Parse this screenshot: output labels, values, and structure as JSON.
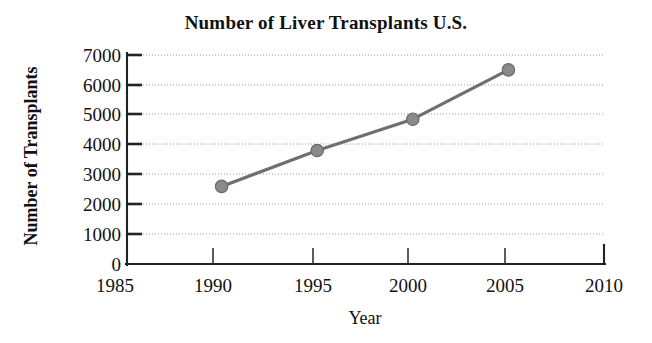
{
  "chart_data": {
    "type": "line",
    "title": "Number of Liver Transplants U.S.",
    "xlabel": "Year",
    "ylabel": "Number of Transplants",
    "x": [
      1990,
      1995,
      2000,
      2005
    ],
    "values": [
      2600,
      3800,
      4850,
      6500
    ],
    "series": [
      {
        "name": "Liver transplants",
        "x": [
          1990,
          1995,
          2000,
          2005
        ],
        "values": [
          2600,
          3800,
          4850,
          6500
        ]
      }
    ],
    "xlim": [
      1985,
      2010
    ],
    "ylim": [
      0,
      7000
    ],
    "xticks": [
      1985,
      1990,
      1995,
      2000,
      2005,
      2010
    ],
    "yticks": [
      0,
      1000,
      2000,
      3000,
      4000,
      5000,
      6000,
      7000
    ],
    "xtick_labels": [
      "1985",
      "1990",
      "1995",
      "2000",
      "2005",
      "2010"
    ],
    "ytick_labels": [
      "0",
      "1000",
      "2000",
      "3000",
      "4000",
      "5000",
      "6000",
      "7000"
    ],
    "grid": true,
    "grid_axis": "y",
    "grid_style": "dotted",
    "legend": false,
    "legend_position": "none",
    "marker": "circle",
    "colors": {
      "line": "#6f6f6f",
      "marker_fill": "#8a8a8a",
      "marker_edge": "#6a6a6a",
      "axis": "#222222",
      "grid": "#9a9a9a",
      "text": "#111111",
      "background": "#ffffff"
    }
  },
  "geometry": {
    "plot_left": 126,
    "plot_right": 604,
    "plot_top": 55,
    "plot_bottom": 264,
    "x_per_year": 19.12,
    "y_per_unit": 0.0299
  }
}
